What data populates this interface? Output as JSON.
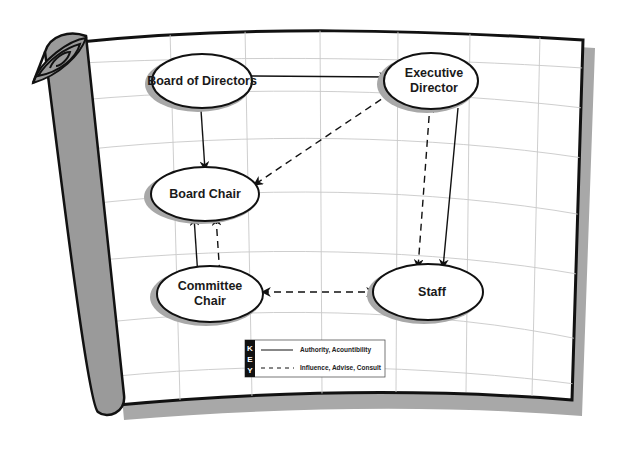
{
  "diagram": {
    "nodes": {
      "board_of_directors": {
        "line1": "Board of Directors"
      },
      "executive_director": {
        "line1": "Executive",
        "line2": "Director"
      },
      "board_chair": {
        "line1": "Board Chair"
      },
      "committee_chair": {
        "line1": "Committee",
        "line2": "Chair"
      },
      "staff": {
        "line1": "Staff"
      }
    },
    "edges": [
      {
        "from": "Board of Directors",
        "to": "Executive Director",
        "type": "solid"
      },
      {
        "from": "Board of Directors",
        "to": "Board Chair",
        "type": "solid"
      },
      {
        "from": "Executive Director",
        "to": "Board Chair",
        "type": "dashed",
        "bidirectional": true
      },
      {
        "from": "Executive Director",
        "to": "Staff",
        "type": "solid"
      },
      {
        "from": "Executive Director",
        "to": "Staff",
        "type": "dashed",
        "bidirectional": true
      },
      {
        "from": "Board Chair",
        "to": "Committee Chair",
        "type": "solid",
        "bidirectional": true
      },
      {
        "from": "Board Chair",
        "to": "Committee Chair",
        "type": "dashed",
        "bidirectional": true
      },
      {
        "from": "Committee Chair",
        "to": "Staff",
        "type": "dashed",
        "bidirectional": true
      }
    ],
    "key": {
      "letters": [
        "K",
        "E",
        "Y"
      ],
      "solid_label": "Authority, Acountibility",
      "dashed_label": "Influence, Advise, Consult"
    },
    "colors": {
      "scroll_gray": "#9a9a9a",
      "shadow_gray": "#a8a8a8",
      "outline": "#111111",
      "grid": "#c8c8c8",
      "node_fill": "#ffffff"
    }
  }
}
